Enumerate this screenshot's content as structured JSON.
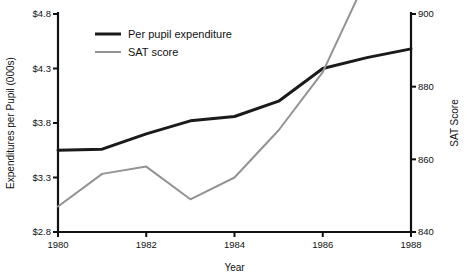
{
  "chart_data": {
    "type": "line",
    "title": "",
    "xlabel": "Year",
    "ylabel": "Expenditures per Pupil (000s)",
    "y2label": "SAT Score",
    "grid": false,
    "legend_position": "top-left-inside",
    "x": [
      1980,
      1981,
      1982,
      1983,
      1984,
      1985,
      1986,
      1987,
      1988
    ],
    "xlim": [
      1980,
      1988
    ],
    "xticks": [
      1980,
      1982,
      1984,
      1986,
      1988
    ],
    "xtick_labels": [
      "1980",
      "1982",
      "1984",
      "1986",
      "1988"
    ],
    "ylim": [
      2.8,
      4.8
    ],
    "yticks": [
      2.8,
      3.3,
      3.8,
      4.3,
      4.8
    ],
    "ytick_labels": [
      "$2.8",
      "$3.3",
      "$3.8",
      "$4.3",
      "$4.8"
    ],
    "y2lim": [
      840,
      900
    ],
    "y2ticks": [
      840,
      860,
      880,
      900
    ],
    "y2tick_labels": [
      "840",
      "860",
      "880",
      "900"
    ],
    "series": [
      {
        "name": "Per pupil expenditure",
        "axis": "left",
        "color": "#1a1a1a",
        "width": 3.0,
        "values": [
          3.55,
          3.56,
          3.7,
          3.82,
          3.86,
          4.0,
          4.3,
          4.4,
          4.48
        ]
      },
      {
        "name": "SAT score",
        "axis": "right",
        "color": "#939393",
        "width": 2.0,
        "values": [
          847,
          856,
          858,
          849,
          855,
          868,
          884,
          910,
          911
        ]
      }
    ]
  },
  "legend": {
    "items": [
      {
        "label": "Per pupil expenditure"
      },
      {
        "label": "SAT score"
      }
    ]
  }
}
